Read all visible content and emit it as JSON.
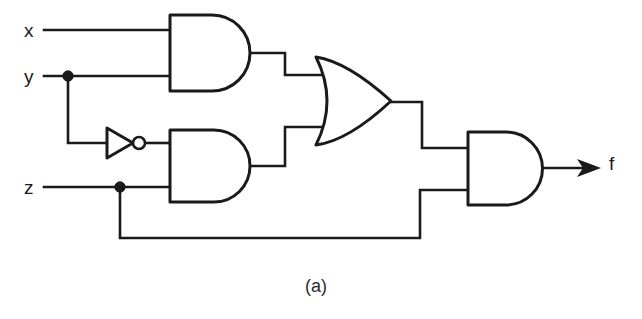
{
  "figure": {
    "caption": "(a)",
    "caption_x": 305,
    "caption_y": 277,
    "background_color": "#ffffff",
    "ink_color": "#1a1a1a",
    "width": 642,
    "height": 319
  },
  "inputs": [
    {
      "name": "input-x",
      "label": "x",
      "x": 24,
      "y": 21,
      "wire_y": 30
    },
    {
      "name": "input-y",
      "label": "y",
      "x": 24,
      "y": 67,
      "wire_y": 76
    },
    {
      "name": "input-z",
      "label": "z",
      "x": 24,
      "y": 178,
      "wire_y": 187
    }
  ],
  "output": {
    "name": "output-f",
    "label": "f",
    "x": 609,
    "y": 154,
    "wire_y": 168
  },
  "gates": [
    {
      "name": "and-gate-1",
      "type": "AND",
      "label": "AND",
      "inputs": [
        "x",
        "y"
      ],
      "x": 170,
      "y": 15,
      "width": 80,
      "height": 76
    },
    {
      "name": "not-gate-1",
      "type": "NOT",
      "label": "NOT",
      "inputs": [
        "y"
      ],
      "x": 107,
      "y": 128,
      "width": 36,
      "height": 30
    },
    {
      "name": "and-gate-2",
      "type": "AND",
      "label": "AND",
      "inputs": [
        "y-inverted",
        "z"
      ],
      "x": 170,
      "y": 130,
      "width": 80,
      "height": 72
    },
    {
      "name": "or-gate-1",
      "type": "OR",
      "label": "OR",
      "inputs": [
        "and-gate-1",
        "and-gate-2"
      ],
      "x": 315,
      "y": 57,
      "width": 76,
      "height": 88
    },
    {
      "name": "and-gate-3",
      "type": "AND",
      "label": "AND",
      "inputs": [
        "or-gate-1",
        "z"
      ],
      "x": 468,
      "y": 132,
      "width": 74,
      "height": 73
    }
  ],
  "junctions": [
    {
      "name": "junction-y",
      "signal": "y",
      "x": 68,
      "y": 76
    },
    {
      "name": "junction-z",
      "signal": "z",
      "x": 120,
      "y": 187
    }
  ],
  "expression": "f = (x·y + y'·z)·z"
}
